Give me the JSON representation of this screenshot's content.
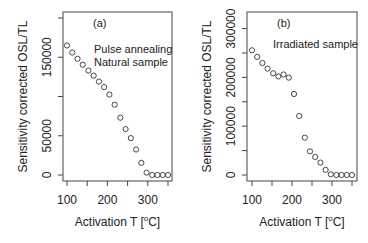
{
  "chart_data": [
    {
      "type": "scatter",
      "panel_label": "(a)",
      "annotation": [
        "Pulse annealing",
        "Natural sample"
      ],
      "xlabel": "Activation T [°C]",
      "ylabel": "Sensitivity corrected OSL/TL",
      "xlim": [
        95,
        357
      ],
      "ylim": [
        0,
        200000
      ],
      "xticks": [
        100,
        150,
        200,
        250,
        300,
        350
      ],
      "xtick_labels": [
        "100",
        "200",
        "300"
      ],
      "yticks": [
        0,
        50000,
        100000,
        150000,
        200000
      ],
      "ytick_labels": [
        "0",
        "50000",
        "150000"
      ],
      "grid": false,
      "legend": "none",
      "marker": "open-circle",
      "x": [
        100,
        113,
        126,
        139,
        153,
        166,
        179,
        192,
        205,
        218,
        232,
        245,
        258,
        271,
        284,
        297,
        311,
        324,
        337,
        350
      ],
      "y": [
        165000,
        156000,
        148000,
        140500,
        133000,
        126500,
        119000,
        112000,
        102500,
        89500,
        73000,
        58500,
        47000,
        32500,
        15500,
        3000,
        0,
        0,
        0,
        0
      ]
    },
    {
      "type": "scatter",
      "panel_label": "(b)",
      "annotation": [
        "Irradiated sample"
      ],
      "xlabel": "Activation T [°C]",
      "ylabel": "Sensitivity corrected OSL/TL",
      "xlim": [
        95,
        357
      ],
      "ylim": [
        0,
        325000
      ],
      "xticks": [
        100,
        150,
        200,
        250,
        300,
        350
      ],
      "xtick_labels": [
        "100",
        "200",
        "300"
      ],
      "yticks": [
        0,
        50000,
        100000,
        150000,
        200000,
        250000,
        300000
      ],
      "ytick_labels": [
        "0",
        "100000",
        "200000",
        "300000"
      ],
      "grid": false,
      "legend": "none",
      "marker": "open-circle",
      "x": [
        100,
        113,
        126,
        139,
        153,
        166,
        179,
        192,
        205,
        218,
        232,
        245,
        258,
        271,
        284,
        297,
        311,
        324,
        337,
        350
      ],
      "y": [
        255500,
        242000,
        229500,
        218000,
        208500,
        202000,
        206000,
        199500,
        166000,
        121000,
        76500,
        48500,
        37000,
        25500,
        10500,
        1500,
        0,
        0,
        0,
        0
      ]
    }
  ],
  "layout": {
    "panels": [
      {
        "box": [
          63,
          12,
          172,
          181
        ],
        "xpx": [
          67,
          168
        ],
        "ypx": [
          175,
          18
        ]
      },
      {
        "box": [
          247,
          12,
          357,
          181
        ],
        "xpx": [
          252,
          352
        ],
        "ypx": [
          175,
          28.6
        ]
      }
    ],
    "ypx_ref_values": [
      [
        0,
        200000
      ],
      [
        0,
        300000
      ]
    ],
    "colors": {
      "axis": "#444444",
      "marker": "#333333",
      "text": "#222222"
    }
  }
}
